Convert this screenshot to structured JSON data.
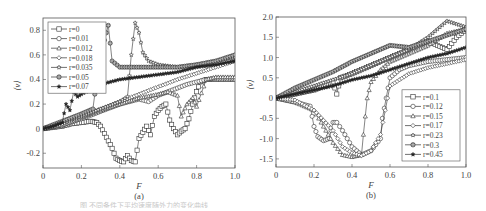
{
  "figure": {
    "panels": [
      "(a)",
      "(b)"
    ]
  },
  "chart_data": [
    {
      "id": "a",
      "type": "line",
      "panel_label": "(a)",
      "title": "",
      "xlabel": "F",
      "ylabel": "⟨v⟩",
      "xlim": [
        0,
        1.0
      ],
      "ylim": [
        -0.32,
        0.9
      ],
      "xticks": [
        "0",
        "0.2",
        "0.4",
        "0.6",
        "0.8",
        "1.0"
      ],
      "xtick_values": [
        0,
        0.2,
        0.4,
        0.6,
        0.8,
        1.0
      ],
      "yticks": [
        "-0.2",
        "0",
        "0.2",
        "0.4",
        "0.6",
        "0.8"
      ],
      "ytick_values": [
        -0.2,
        0,
        0.2,
        0.4,
        0.6,
        0.8
      ],
      "grid": false,
      "legend_position": "upper left",
      "frame": {
        "x": 43,
        "y": 18,
        "w": 192,
        "h": 150
      },
      "series": [
        {
          "name": "r=0",
          "marker": "square-open",
          "x": [
            0,
            0.05,
            0.1,
            0.15,
            0.2,
            0.25,
            0.28,
            0.3,
            0.32,
            0.34,
            0.36,
            0.38,
            0.4,
            0.42,
            0.44,
            0.46,
            0.48,
            0.5,
            0.52,
            0.54,
            0.56,
            0.58,
            0.6,
            0.62,
            0.64,
            0.66,
            0.68,
            0.7,
            0.72,
            0.74,
            0.76,
            0.78,
            0.8,
            0.82,
            0.85,
            0.9,
            0.95,
            1.0
          ],
          "y": [
            0,
            0.01,
            0.02,
            0.04,
            0.05,
            0.06,
            0.05,
            0.02,
            -0.04,
            -0.1,
            -0.16,
            -0.24,
            -0.26,
            -0.27,
            -0.22,
            -0.26,
            -0.27,
            -0.08,
            -0.03,
            0.02,
            -0.05,
            0.1,
            0.15,
            0.18,
            0.2,
            0.07,
            0.0,
            -0.05,
            -0.02,
            0.0,
            0.08,
            0.2,
            0.3,
            0.38,
            0.4,
            0.4,
            0.4,
            0.4
          ]
        },
        {
          "name": "r=0.01",
          "marker": "circle-open",
          "x": [
            0,
            0.1,
            0.2,
            0.3,
            0.4,
            0.5,
            0.55,
            0.6,
            0.65,
            0.7,
            0.75,
            0.8,
            0.85,
            0.9,
            0.95,
            1.0
          ],
          "y": [
            0,
            0.03,
            0.08,
            0.14,
            0.2,
            0.24,
            0.22,
            0.27,
            0.3,
            0.33,
            0.36,
            0.38,
            0.4,
            0.41,
            0.41,
            0.41
          ]
        },
        {
          "name": "r=0.012",
          "marker": "triangle-open",
          "x": [
            0,
            0.1,
            0.2,
            0.3,
            0.4,
            0.5,
            0.6,
            0.65,
            0.7,
            0.72,
            0.75,
            0.78,
            0.8,
            0.85,
            0.9,
            0.95,
            1.0
          ],
          "y": [
            0,
            0.03,
            0.09,
            0.15,
            0.2,
            0.25,
            0.28,
            0.3,
            0.27,
            0.1,
            0.2,
            0.25,
            0.18,
            0.4,
            0.42,
            0.42,
            0.42
          ]
        },
        {
          "name": "r=0.018",
          "marker": "diamond-open",
          "x": [
            0,
            0.1,
            0.2,
            0.3,
            0.4,
            0.5,
            0.6,
            0.7,
            0.8,
            0.9,
            1.0
          ],
          "y": [
            0,
            0.04,
            0.1,
            0.16,
            0.22,
            0.28,
            0.34,
            0.4,
            0.45,
            0.5,
            0.55
          ]
        },
        {
          "name": "r=0.035",
          "marker": "star-open",
          "x": [
            0,
            0.1,
            0.2,
            0.3,
            0.4,
            0.44,
            0.46,
            0.48,
            0.5,
            0.52,
            0.55,
            0.6,
            0.7,
            0.8,
            0.9,
            1.0
          ],
          "y": [
            0,
            0.05,
            0.1,
            0.16,
            0.22,
            0.26,
            0.6,
            0.86,
            0.78,
            0.62,
            0.55,
            0.52,
            0.5,
            0.52,
            0.55,
            0.58
          ]
        },
        {
          "name": "r=0.05",
          "marker": "circle-cross",
          "x": [
            0,
            0.1,
            0.2,
            0.26,
            0.28,
            0.3,
            0.32,
            0.34,
            0.36,
            0.4,
            0.5,
            0.6,
            0.7,
            0.8,
            0.9,
            1.0
          ],
          "y": [
            0,
            0.06,
            0.12,
            0.16,
            0.4,
            0.76,
            0.72,
            0.84,
            0.55,
            0.5,
            0.5,
            0.5,
            0.5,
            0.52,
            0.55,
            0.6
          ]
        },
        {
          "name": "r=0.07",
          "marker": "star-filled",
          "x": [
            0,
            0.05,
            0.1,
            0.12,
            0.14,
            0.16,
            0.18,
            0.2,
            0.25,
            0.3,
            0.4,
            0.5,
            0.6,
            0.7,
            0.8,
            0.9,
            1.0
          ],
          "y": [
            0,
            0.02,
            0.05,
            0.2,
            0.15,
            0.3,
            0.26,
            0.28,
            0.32,
            0.36,
            0.4,
            0.42,
            0.44,
            0.46,
            0.5,
            0.52,
            0.55
          ]
        }
      ]
    },
    {
      "id": "b",
      "type": "line",
      "panel_label": "(b)",
      "title": "",
      "xlabel": "F",
      "ylabel": "⟨v⟩",
      "xlim": [
        0,
        1.0
      ],
      "ylim": [
        -1.7,
        2.0
      ],
      "xticks": [
        "0",
        "0.2",
        "0.4",
        "0.6",
        "0.8",
        "1.0"
      ],
      "xtick_values": [
        0,
        0.2,
        0.4,
        0.6,
        0.8,
        1.0
      ],
      "yticks": [
        "-1.5",
        "-1.0",
        "-0.5",
        "0",
        "0.5",
        "1.0",
        "1.5",
        "2.0"
      ],
      "ytick_values": [
        -1.5,
        -1.0,
        -0.5,
        0,
        0.5,
        1.0,
        1.5,
        2.0
      ],
      "grid": false,
      "legend_position": "lower right",
      "frame": {
        "x": 276,
        "y": 17,
        "w": 190,
        "h": 150
      },
      "series": [
        {
          "name": "r=0.1",
          "marker": "square-open",
          "x": [
            0,
            0.1,
            0.2,
            0.3,
            0.32,
            0.34,
            0.4,
            0.5,
            0.6,
            0.7,
            0.8,
            0.85,
            0.9,
            0.95,
            1.0
          ],
          "y": [
            0,
            0.1,
            0.2,
            0.4,
            0.1,
            0.5,
            0.6,
            0.8,
            1.0,
            1.2,
            1.4,
            1.3,
            1.2,
            1.5,
            1.7
          ]
        },
        {
          "name": "r=0.12",
          "marker": "circle-open",
          "x": [
            0,
            0.1,
            0.18,
            0.2,
            0.22,
            0.25,
            0.28,
            0.3,
            0.32,
            0.35,
            0.4,
            0.45,
            0.5,
            0.55,
            0.56,
            0.58,
            0.6,
            0.65,
            0.7,
            0.8,
            0.9,
            1.0
          ],
          "y": [
            0,
            -0.1,
            -0.2,
            -0.7,
            -0.95,
            -1.05,
            -1.0,
            -0.6,
            -0.6,
            -0.8,
            -1.2,
            -1.4,
            -1.3,
            -1.0,
            -0.5,
            0.0,
            0.5,
            0.7,
            0.8,
            0.9,
            0.95,
            1.0
          ]
        },
        {
          "name": "r=0.15",
          "marker": "triangle-open",
          "x": [
            0,
            0.1,
            0.2,
            0.25,
            0.3,
            0.35,
            0.4,
            0.45,
            0.46,
            0.48,
            0.5,
            0.55,
            0.6,
            0.7,
            0.8,
            0.9,
            1.0
          ],
          "y": [
            0,
            -0.1,
            -0.3,
            -0.7,
            -1.1,
            -1.4,
            -1.45,
            -1.4,
            -0.9,
            0.0,
            0.4,
            0.7,
            0.9,
            1.1,
            1.3,
            1.6,
            1.7
          ]
        },
        {
          "name": "r=0.17",
          "marker": "diamond-open",
          "x": [
            0,
            0.1,
            0.2,
            0.3,
            0.35,
            0.4,
            0.45,
            0.5,
            0.55,
            0.6,
            0.7,
            0.8,
            0.9,
            1.0
          ],
          "y": [
            0,
            -0.05,
            -0.3,
            -0.8,
            -1.2,
            -1.35,
            -1.42,
            -1.3,
            -0.9,
            0.3,
            0.6,
            0.75,
            0.85,
            0.95
          ]
        },
        {
          "name": "r=0.23",
          "marker": "star-open",
          "x": [
            0,
            0.1,
            0.2,
            0.3,
            0.4,
            0.5,
            0.6,
            0.7,
            0.8,
            0.9,
            1.0
          ],
          "y": [
            0,
            0.15,
            0.3,
            0.45,
            0.6,
            0.8,
            1.0,
            1.2,
            1.5,
            1.9,
            1.75
          ]
        },
        {
          "name": "r=0.3",
          "marker": "circle-cross",
          "x": [
            0,
            0.1,
            0.2,
            0.3,
            0.4,
            0.5,
            0.6,
            0.7,
            0.8,
            0.9,
            1.0
          ],
          "y": [
            0,
            0.25,
            0.45,
            0.65,
            0.9,
            1.1,
            1.3,
            1.25,
            1.4,
            1.55,
            1.7
          ]
        },
        {
          "name": "r=0.45",
          "marker": "star-filled",
          "x": [
            0,
            0.1,
            0.2,
            0.3,
            0.4,
            0.5,
            0.6,
            0.7,
            0.8,
            0.9,
            1.0
          ],
          "y": [
            0,
            0.1,
            0.2,
            0.3,
            0.45,
            0.55,
            0.7,
            0.85,
            1.0,
            1.1,
            1.25
          ]
        }
      ]
    }
  ],
  "caption": "图  不同条件下平均速度随外力的变化曲线"
}
